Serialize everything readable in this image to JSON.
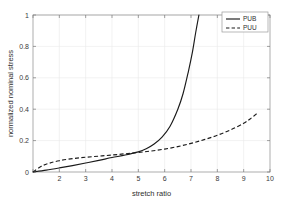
{
  "chart_data": {
    "type": "line",
    "title": "",
    "subtitle": "",
    "xlabel": "stretch ratio",
    "ylabel": "normalized nominal stress",
    "xlim": [
      1,
      10
    ],
    "ylim": [
      0,
      1
    ],
    "xticks": [
      1,
      2,
      3,
      4,
      5,
      6,
      7,
      8,
      9,
      10
    ],
    "xticklabels": [
      "",
      "2",
      "3",
      "4",
      "5",
      "6",
      "7",
      "8",
      "9",
      "10"
    ],
    "yticks": [
      0,
      0.2,
      0.4,
      0.6,
      0.8,
      1
    ],
    "yticklabels": [
      "0",
      "0.2",
      "0.4",
      "0.6",
      "0.8",
      "1"
    ],
    "grid": true,
    "legend_position": "top-right",
    "series": [
      {
        "name": "PUB",
        "style": "solid",
        "color": "#1a1a1a",
        "x": [
          1.0,
          1.5,
          2.0,
          2.5,
          3.0,
          3.5,
          4.0,
          4.5,
          5.0,
          5.3,
          5.6,
          5.9,
          6.2,
          6.5,
          6.7,
          6.9,
          7.05,
          7.18,
          7.3
        ],
        "y": [
          0.0,
          0.012,
          0.026,
          0.041,
          0.057,
          0.074,
          0.092,
          0.108,
          0.128,
          0.148,
          0.178,
          0.222,
          0.29,
          0.4,
          0.5,
          0.64,
          0.76,
          0.89,
          1.0
        ]
      },
      {
        "name": "PUU",
        "style": "dashed",
        "color": "#1a1a1a",
        "x": [
          1.0,
          1.3,
          1.6,
          2.0,
          2.5,
          3.0,
          3.5,
          4.0,
          4.5,
          5.0,
          5.5,
          6.0,
          6.5,
          7.0,
          7.5,
          8.0,
          8.5,
          9.0,
          9.3,
          9.5
        ],
        "y": [
          0.0,
          0.035,
          0.055,
          0.072,
          0.085,
          0.094,
          0.101,
          0.108,
          0.116,
          0.124,
          0.134,
          0.146,
          0.162,
          0.182,
          0.206,
          0.234,
          0.268,
          0.31,
          0.345,
          0.372
        ]
      }
    ],
    "legend": [
      {
        "label": "PUB",
        "style": "solid"
      },
      {
        "label": "PUU",
        "style": "dashed"
      }
    ]
  }
}
